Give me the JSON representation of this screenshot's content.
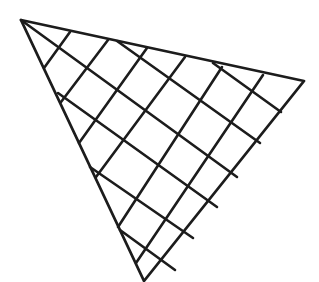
{
  "figure": {
    "description": "Hand-drawn triangle filled with a crosshatch grid of two families of parallel lines",
    "stroke_color": "#1c1c1c",
    "background_color": "#ffffff",
    "triangle": {
      "vertices": [
        [
          21,
          20
        ],
        [
          304,
          81
        ],
        [
          144,
          281
        ]
      ]
    },
    "grid_lines_down_right": [
      [
        [
          21,
          20
        ],
        [
          237,
          177
        ]
      ],
      [
        [
          117,
          41
        ],
        [
          260,
          143
        ]
      ],
      [
        [
          213,
          63
        ],
        [
          281,
          112
        ]
      ],
      [
        [
          58,
          93
        ],
        [
          217,
          207
        ]
      ],
      [
        [
          90,
          167
        ],
        [
          193,
          238
        ]
      ],
      [
        [
          120,
          230
        ],
        [
          175,
          270
        ]
      ]
    ],
    "grid_lines_up_right": [
      [
        [
          44,
          68
        ],
        [
          70,
          32
        ]
      ],
      [
        [
          61,
          102
        ],
        [
          108,
          40
        ]
      ],
      [
        [
          79,
          143
        ],
        [
          147,
          48
        ]
      ],
      [
        [
          96,
          177
        ],
        [
          185,
          57
        ]
      ],
      [
        [
          118,
          227
        ],
        [
          222,
          67
        ]
      ],
      [
        [
          136,
          263
        ],
        [
          263,
          75
        ]
      ]
    ]
  }
}
